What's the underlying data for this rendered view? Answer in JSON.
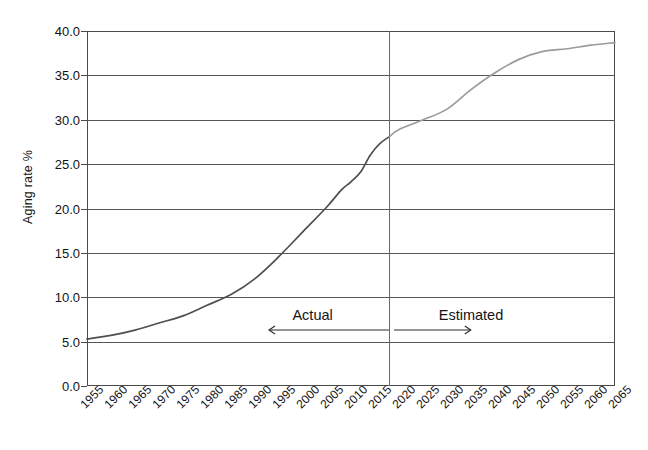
{
  "chart_data": {
    "type": "line",
    "title": "",
    "xlabel": "",
    "ylabel": "Aging rate %",
    "xlim": [
      1955,
      2065
    ],
    "ylim": [
      0.0,
      40.0
    ],
    "ytick_labels": [
      "40.0",
      "35.0",
      "30.0",
      "25.0",
      "20.0",
      "15.0",
      "10.0",
      "5.0",
      "0.0"
    ],
    "ytick_values": [
      40.0,
      35.0,
      30.0,
      25.0,
      20.0,
      15.0,
      10.0,
      5.0,
      0.0
    ],
    "xtick_labels": [
      "1955",
      "1960",
      "1965",
      "1970",
      "1975",
      "1980",
      "1985",
      "1990",
      "1995",
      "2000",
      "2005",
      "2010",
      "2015",
      "2020",
      "2025",
      "2030",
      "2035",
      "2040",
      "2045",
      "2050",
      "2055",
      "2060",
      "2065"
    ],
    "xtick_values": [
      1955,
      1960,
      1965,
      1970,
      1975,
      1980,
      1985,
      1990,
      1995,
      2000,
      2005,
      2010,
      2015,
      2020,
      2025,
      2030,
      2035,
      2040,
      2045,
      2050,
      2055,
      2060,
      2065
    ],
    "grid": true,
    "legend_position": "none",
    "series": [
      {
        "name": "Actual",
        "color": "#4f4f52",
        "x": [
          1955,
          1960,
          1965,
          1970,
          1975,
          1980,
          1985,
          1990,
          1995,
          2000,
          2005,
          2008,
          2010,
          2012,
          2014,
          2016,
          2018
        ],
        "values": [
          5.3,
          5.7,
          6.3,
          7.1,
          7.9,
          9.1,
          10.3,
          12.1,
          14.6,
          17.4,
          20.2,
          22.1,
          23.0,
          24.1,
          26.0,
          27.3,
          28.1
        ]
      },
      {
        "name": "Estimated",
        "color": "#9b9ba0",
        "x": [
          2018,
          2020,
          2025,
          2030,
          2035,
          2040,
          2045,
          2050,
          2055,
          2060,
          2065
        ],
        "values": [
          28.1,
          28.9,
          30.0,
          31.2,
          33.4,
          35.3,
          36.8,
          37.7,
          38.0,
          38.4,
          38.7
        ]
      }
    ],
    "annotations": [
      {
        "name": "actual-label",
        "text": "Actual",
        "x": 2002,
        "y": 7.9,
        "arrow": "left",
        "arrow_from": 2018,
        "arrow_to": 1993
      },
      {
        "name": "estimated-label",
        "text": "Estimated",
        "x": 2035,
        "y": 7.9,
        "arrow": "right",
        "arrow_from": 2019,
        "arrow_to": 2035
      }
    ],
    "divider": {
      "x": 2018,
      "label": "actual-estimated-boundary"
    }
  }
}
